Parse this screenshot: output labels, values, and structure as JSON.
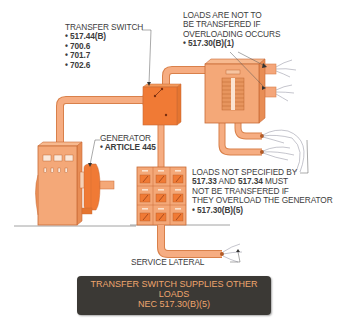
{
  "diagram": {
    "title": "Transfer switch supplies other loads",
    "colors": {
      "conduit": "#f4a67a",
      "conduit_edge": "#d9804a",
      "equipment": "#f4a878",
      "equipment_dark": "#f07a35",
      "equipment_edge": "#c96a35",
      "label_text": "#3c3c3c",
      "caption_bg": "#3b3935",
      "caption_text": "#eea56d"
    },
    "components": [
      {
        "id": "transfer-switch",
        "label": "TRANSFER SWITCH",
        "refs": [
          "517.44(B)",
          "700.6",
          "701.7",
          "702.6"
        ]
      },
      {
        "id": "generator",
        "label": "GENERATOR",
        "refs": [
          "ARTICLE 445"
        ]
      },
      {
        "id": "panelboard",
        "label": "LOADS ARE NOT TO BE TRANSFERED IF OVERLOADING OCCURS",
        "refs": [
          "517.30(B)(1)"
        ]
      },
      {
        "id": "meter-stack",
        "label": "LOADS NOT SPECIFIED BY 517.33 AND 517.34 MUST NOT BE TRANSFERED IF THEY OVERLOAD THE GENERATOR",
        "refs": [
          "517.30(B)(5)"
        ]
      },
      {
        "id": "service-lateral",
        "label": "SERVICE LATERAL",
        "refs": []
      }
    ]
  },
  "labels": {
    "transfer_switch": {
      "title": "TRANSFER SWITCH",
      "bullet": "•",
      "items": [
        "517.44(B)",
        "700.6",
        "701.7",
        "702.6"
      ]
    },
    "loads_not_transferred": {
      "lines": [
        "LOADS ARE NOT TO",
        "BE TRANSFERED IF",
        "OVERLOADING OCCURS"
      ],
      "bullet": "•",
      "ref": "517.30(B)(1)"
    },
    "generator": {
      "title": "GENERATOR",
      "bullet": "•",
      "ref": "ARTICLE 445"
    },
    "loads_not_specified": {
      "line1": "LOADS NOT SPECIFIED BY",
      "line2_ref_a": "517.33",
      "line2_and": " AND ",
      "line2_ref_b": "517.34",
      "line2_rest": " MUST",
      "line3": "NOT BE TRANSFERED IF",
      "line4": "THEY OVERLOAD THE GENERATOR",
      "bullet": "•",
      "ref": "517.30(B)(5)"
    },
    "service_lateral": {
      "title": "SERVICE LATERAL"
    }
  },
  "caption": {
    "line1": "TRANSFER SWITCH SUPPLIES OTHER",
    "line2": "LOADS",
    "line3": "NEC 517.30(B)(5)"
  }
}
